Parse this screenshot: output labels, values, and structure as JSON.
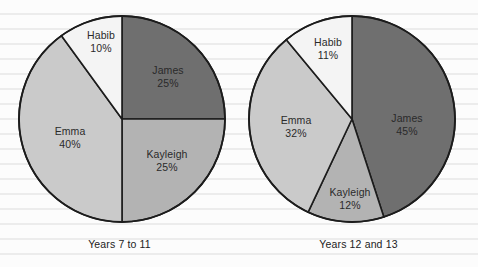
{
  "page": {
    "background": "ruled-paper",
    "rule_color": "#ececec",
    "paper_color": "#fcfcfc"
  },
  "chart_data": [
    {
      "type": "pie",
      "title": "Years 7 to 11",
      "caption": "Years 7 to 11",
      "categories": [
        "James",
        "Kayleigh",
        "Emma",
        "Habib"
      ],
      "values": [
        25,
        25,
        40,
        10
      ],
      "value_labels": [
        "25%",
        "25%",
        "40%",
        "10%"
      ],
      "unit": "%",
      "start_angle_deg": 0,
      "direction": "clockwise",
      "legend": "none",
      "labels_inside": true,
      "colors": [
        "#6f6f6f",
        "#b3b3b3",
        "#cacaca",
        "#f4f4f4"
      ],
      "stroke": "#1c1c1c",
      "center": {
        "cx": 122,
        "cy": 119,
        "r": 103
      },
      "slices": [
        {
          "name": "James",
          "value": 25,
          "label": "James",
          "pct": "25%",
          "color": "#6f6f6f",
          "lx": 168,
          "ly": 76
        },
        {
          "name": "Kayleigh",
          "value": 25,
          "label": "Kayleigh",
          "pct": "25%",
          "color": "#b3b3b3",
          "lx": 167,
          "ly": 160
        },
        {
          "name": "Emma",
          "value": 40,
          "label": "Emma",
          "pct": "40%",
          "color": "#cacaca",
          "lx": 70,
          "ly": 137
        },
        {
          "name": "Habib",
          "value": 10,
          "label": "Habib",
          "pct": "10%",
          "color": "#f4f4f4",
          "lx": 101,
          "ly": 41
        }
      ]
    },
    {
      "type": "pie",
      "title": "Years 12 and 13",
      "caption": "Years 12 and 13",
      "categories": [
        "James",
        "Kayleigh",
        "Emma",
        "Habib"
      ],
      "values": [
        45,
        12,
        32,
        11
      ],
      "value_labels": [
        "45%",
        "12%",
        "32%",
        "11%"
      ],
      "unit": "%",
      "start_angle_deg": 0,
      "direction": "clockwise",
      "legend": "none",
      "labels_inside": true,
      "colors": [
        "#6f6f6f",
        "#b3b3b3",
        "#cacaca",
        "#f4f4f4"
      ],
      "stroke": "#1c1c1c",
      "center": {
        "cx": 113,
        "cy": 119,
        "r": 103
      },
      "slices": [
        {
          "name": "James",
          "value": 45,
          "label": "James",
          "pct": "45%",
          "color": "#6f6f6f",
          "lx": 168,
          "ly": 124
        },
        {
          "name": "Kayleigh",
          "value": 12,
          "label": "Kayleigh",
          "pct": "12%",
          "color": "#b3b3b3",
          "lx": 111,
          "ly": 198
        },
        {
          "name": "Emma",
          "value": 32,
          "label": "Emma",
          "pct": "32%",
          "color": "#cacaca",
          "lx": 57,
          "ly": 126
        },
        {
          "name": "Habib",
          "value": 11,
          "label": "Habib",
          "pct": "11%",
          "color": "#f4f4f4",
          "lx": 89,
          "ly": 48
        }
      ]
    }
  ]
}
